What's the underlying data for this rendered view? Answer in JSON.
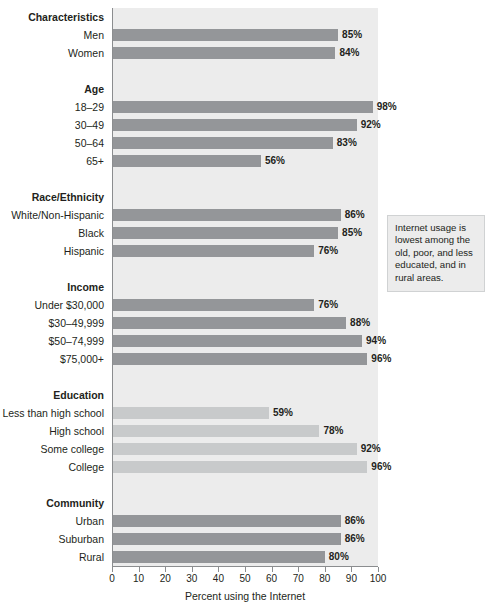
{
  "chart_data": {
    "type": "bar",
    "orientation": "horizontal",
    "title": "",
    "xlabel": "Percent using the Internet",
    "ylabel": "",
    "xlim": [
      0,
      100
    ],
    "xticks": [
      0,
      10,
      20,
      30,
      40,
      50,
      60,
      70,
      80,
      90,
      100
    ],
    "grid": false,
    "legend": null,
    "value_suffix": "%",
    "colors": {
      "bar_default": "#949699",
      "bar_light": "#c8cacb",
      "plot_background": "#ececec",
      "axis": "#8b8d8f",
      "text": "#231f20",
      "callout_background": "#ececec",
      "callout_border": "#d0d2d3"
    },
    "group_header": "Characteristics",
    "groups": [
      {
        "name": "",
        "is_header_row": false,
        "items": [
          {
            "label": "Men",
            "value": 85,
            "value_label": "85%",
            "shade": "default"
          },
          {
            "label": "Women",
            "value": 84,
            "value_label": "84%",
            "shade": "default"
          }
        ]
      },
      {
        "name": "Age",
        "is_header_row": true,
        "items": [
          {
            "label": "18–29",
            "value": 98,
            "value_label": "98%",
            "shade": "default"
          },
          {
            "label": "30–49",
            "value": 92,
            "value_label": "92%",
            "shade": "default"
          },
          {
            "label": "50–64",
            "value": 83,
            "value_label": "83%",
            "shade": "default"
          },
          {
            "label": "65+",
            "value": 56,
            "value_label": "56%",
            "shade": "default"
          }
        ]
      },
      {
        "name": "Race/Ethnicity",
        "is_header_row": true,
        "items": [
          {
            "label": "White/Non-Hispanic",
            "value": 86,
            "value_label": "86%",
            "shade": "default"
          },
          {
            "label": "Black",
            "value": 85,
            "value_label": "85%",
            "shade": "default"
          },
          {
            "label": "Hispanic",
            "value": 76,
            "value_label": "76%",
            "shade": "default"
          }
        ]
      },
      {
        "name": "Income",
        "is_header_row": true,
        "items": [
          {
            "label": "Under $30,000",
            "value": 76,
            "value_label": "76%",
            "shade": "default"
          },
          {
            "label": "$30–49,999",
            "value": 88,
            "value_label": "88%",
            "shade": "default"
          },
          {
            "label": "$50–74,999",
            "value": 94,
            "value_label": "94%",
            "shade": "default"
          },
          {
            "label": "$75,000+",
            "value": 96,
            "value_label": "96%",
            "shade": "default"
          }
        ]
      },
      {
        "name": "Education",
        "is_header_row": true,
        "items": [
          {
            "label": "Less than high school",
            "value": 59,
            "value_label": "59%",
            "shade": "light"
          },
          {
            "label": "High school",
            "value": 78,
            "value_label": "78%",
            "shade": "light"
          },
          {
            "label": "Some college",
            "value": 92,
            "value_label": "92%",
            "shade": "light"
          },
          {
            "label": "College",
            "value": 96,
            "value_label": "96%",
            "shade": "light"
          }
        ]
      },
      {
        "name": "Community",
        "is_header_row": true,
        "items": [
          {
            "label": "Urban",
            "value": 86,
            "value_label": "86%",
            "shade": "default"
          },
          {
            "label": "Suburban",
            "value": 86,
            "value_label": "86%",
            "shade": "default"
          },
          {
            "label": "Rural",
            "value": 80,
            "value_label": "80%",
            "shade": "default"
          }
        ]
      }
    ],
    "annotations": [
      {
        "id": "callout",
        "text": "Internet usage is lowest among the old, poor, and less educated, and in rural areas."
      }
    ]
  }
}
